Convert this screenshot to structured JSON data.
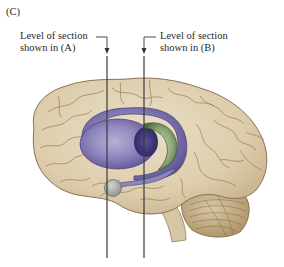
{
  "figure": {
    "panel_label": "(C)",
    "section_a": {
      "line1": "Level of section",
      "line2": "shown in (A)"
    },
    "section_b": {
      "line1": "Level of section",
      "line2": "shown in (B)"
    },
    "structures": [
      {
        "name": "cerebral-cortex",
        "color": "#e3d6bb"
      },
      {
        "name": "lateral-ventricle",
        "color": "#8a7fb8"
      },
      {
        "name": "caudate-thalamus",
        "color": "#7f9a6a"
      },
      {
        "name": "amygdala",
        "color": "#a9ada3"
      },
      {
        "name": "cerebellum",
        "color": "#cdbb98"
      }
    ],
    "colors": {
      "background": "#ffffff",
      "text": "#2a2a2a",
      "line": "#333333",
      "cortex_outline": "#8a7250"
    }
  }
}
